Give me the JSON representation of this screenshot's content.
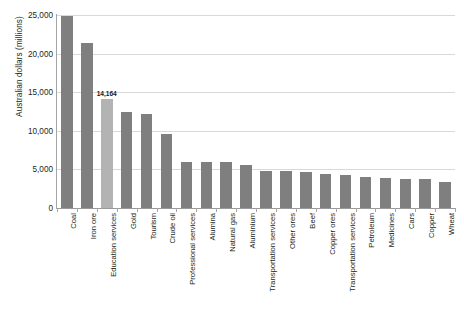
{
  "chart_data": {
    "type": "bar",
    "title": "",
    "xlabel": "",
    "ylabel": "Australian dollars (millions)",
    "ylim": [
      0,
      25000
    ],
    "ytick_labels": [
      "25,000",
      "20,000",
      "15,000",
      "10,000",
      "5,000",
      "0"
    ],
    "ytick_values": [
      25000,
      20000,
      15000,
      10000,
      5000,
      0
    ],
    "grid": true,
    "legend": "none",
    "highlight_category": "Education services",
    "annotations": [
      {
        "category": "Education services",
        "text": "14,164",
        "value": 14164
      }
    ],
    "colors": {
      "bar": "#7f7f7f",
      "bar_highlight": "#b3b3b3",
      "gridline": "#d9d9d9",
      "axis": "#a6a6a6",
      "text": "#231f20",
      "background": "#ffffff"
    },
    "categories": [
      "Coal",
      "Iron ore",
      "Education services",
      "Gold",
      "Tourism",
      "Crude oil",
      "Professional services",
      "Alumina",
      "Natural gas",
      "Aluminium",
      "Transportation services",
      "Other ores",
      "Beef",
      "Copper ores",
      "Transportation services",
      "Petroleum",
      "Medicines",
      "Cars",
      "Copper",
      "Wheat"
    ],
    "values": [
      24900,
      21400,
      14164,
      12400,
      12150,
      9650,
      5950,
      5950,
      5900,
      5600,
      4850,
      4850,
      4700,
      4350,
      4250,
      4050,
      3950,
      3800,
      3700,
      3400
    ]
  }
}
